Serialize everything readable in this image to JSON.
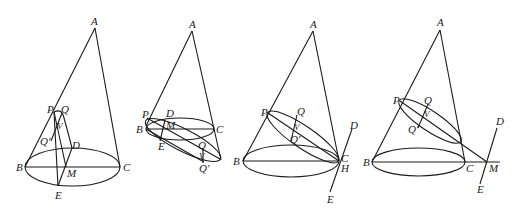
{
  "figures": [
    {
      "id": "fig1",
      "labels": {
        "A": "A",
        "P": "P",
        "Q": "Q",
        "V": "V",
        "Q_prime": "Q′",
        "D": "D",
        "B": "B",
        "M": "M",
        "C": "C",
        "E": "E"
      }
    },
    {
      "id": "fig2",
      "labels": {
        "A": "A",
        "P": "P",
        "D": "D",
        "B": "B",
        "M": "M",
        "C": "C",
        "E": "E",
        "Q": "Q",
        "V": "V",
        "Q_prime": "Q′"
      }
    },
    {
      "id": "fig3",
      "labels": {
        "A": "A",
        "P": "P",
        "Q": "Q",
        "V": "V",
        "Q_prime": "Q′",
        "B": "B",
        "C": "C",
        "H": "H",
        "D": "D",
        "E": "E"
      }
    },
    {
      "id": "fig4",
      "labels": {
        "A": "A",
        "P": "P",
        "Q": "Q",
        "V": "V",
        "Q_prime": "Q′",
        "B": "B",
        "C": "C",
        "M": "M",
        "D": "D",
        "E": "E"
      }
    }
  ],
  "colors": {
    "stroke": "#1a1a1a",
    "background": "#ffffff"
  }
}
